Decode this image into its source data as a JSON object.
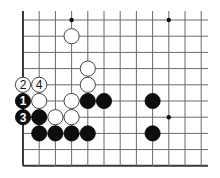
{
  "diagram": {
    "type": "go-board-fragment",
    "visible_columns": 12,
    "visible_rows": 10,
    "edges": [
      "left",
      "bottom"
    ],
    "star_points": [
      {
        "col": 3,
        "row": 0
      },
      {
        "col": 9,
        "row": 0
      },
      {
        "col": 9,
        "row": 6
      }
    ],
    "stones": [
      {
        "color": "white",
        "col": 3,
        "row": 1,
        "label": ""
      },
      {
        "color": "white",
        "col": 4,
        "row": 3,
        "label": ""
      },
      {
        "color": "white",
        "col": 0,
        "row": 4,
        "label": "2"
      },
      {
        "color": "white",
        "col": 1,
        "row": 4,
        "label": "4"
      },
      {
        "color": "white",
        "col": 4,
        "row": 4,
        "label": ""
      },
      {
        "color": "black",
        "col": 0,
        "row": 5,
        "label": "1"
      },
      {
        "color": "white",
        "col": 1,
        "row": 5,
        "label": ""
      },
      {
        "color": "white",
        "col": 3,
        "row": 5,
        "label": ""
      },
      {
        "color": "black",
        "col": 4,
        "row": 5,
        "label": ""
      },
      {
        "color": "black",
        "col": 5,
        "row": 5,
        "label": ""
      },
      {
        "color": "black",
        "col": 8,
        "row": 5,
        "label": ""
      },
      {
        "color": "black",
        "col": 0,
        "row": 6,
        "label": "3"
      },
      {
        "color": "black",
        "col": 1,
        "row": 6,
        "label": ""
      },
      {
        "color": "white",
        "col": 2,
        "row": 6,
        "label": ""
      },
      {
        "color": "white",
        "col": 3,
        "row": 6,
        "label": ""
      },
      {
        "color": "black",
        "col": 1,
        "row": 7,
        "label": ""
      },
      {
        "color": "black",
        "col": 2,
        "row": 7,
        "label": ""
      },
      {
        "color": "black",
        "col": 3,
        "row": 7,
        "label": ""
      },
      {
        "color": "black",
        "col": 4,
        "row": 7,
        "label": ""
      },
      {
        "color": "black",
        "col": 8,
        "row": 7,
        "label": ""
      }
    ]
  }
}
